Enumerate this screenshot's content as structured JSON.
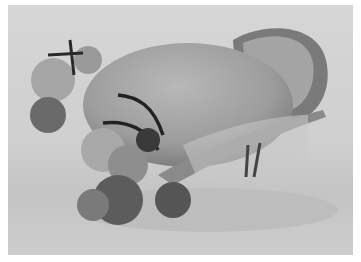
{
  "image": {
    "subject": "straw hat with fabric flowers, feathers and veil netting",
    "palette": {
      "background": "#d2d2d2",
      "straw": "#9a9a9a",
      "straw_light": "#b5b5b5",
      "brim_dark": "#6e6e6e",
      "flower_light": "#a8a8a8",
      "flower_dark": "#5a5a5a",
      "feather": "#2a2a2a",
      "border": "#ffffff"
    }
  }
}
